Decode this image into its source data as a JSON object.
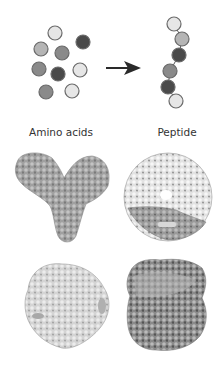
{
  "labels": {
    "amino_acids": "Amino acids",
    "peptide": "Peptide"
  },
  "colors": {
    "light": "#e6e6e6",
    "midlight": "#b5b5b5",
    "mid": "#8a8a8a",
    "dark": "#4a4a4a",
    "stroke": "#6a6a6a",
    "arrow": "#2a2a2a"
  },
  "amino_acid_circles": [
    {
      "cx": 55,
      "cy": 33,
      "shade": "light"
    },
    {
      "cx": 83,
      "cy": 42,
      "shade": "dark"
    },
    {
      "cx": 41,
      "cy": 49,
      "shade": "midlight"
    },
    {
      "cx": 62,
      "cy": 53,
      "shade": "mid"
    },
    {
      "cx": 39,
      "cy": 69,
      "shade": "mid"
    },
    {
      "cx": 58,
      "cy": 74,
      "shade": "dark"
    },
    {
      "cx": 80,
      "cy": 70,
      "shade": "light"
    },
    {
      "cx": 46,
      "cy": 92,
      "shade": "mid"
    },
    {
      "cx": 72,
      "cy": 91,
      "shade": "light"
    }
  ],
  "peptide_circles": [
    {
      "cx": 174,
      "cy": 24,
      "shade": "light"
    },
    {
      "cx": 182,
      "cy": 39,
      "shade": "midlight"
    },
    {
      "cx": 179,
      "cy": 55,
      "shade": "dark"
    },
    {
      "cx": 170,
      "cy": 71,
      "shade": "mid"
    },
    {
      "cx": 168,
      "cy": 87,
      "shade": "dark"
    },
    {
      "cx": 176,
      "cy": 101,
      "shade": "light"
    }
  ],
  "proteins": [
    {
      "id": "protein-y-shaped",
      "shade": "#a8a8a8"
    },
    {
      "id": "protein-ring",
      "shade": "#d0d0d0"
    },
    {
      "id": "protein-globular-light",
      "shade": "#cfcfcf"
    },
    {
      "id": "protein-globular-dark",
      "shade": "#8e8e8e"
    }
  ]
}
